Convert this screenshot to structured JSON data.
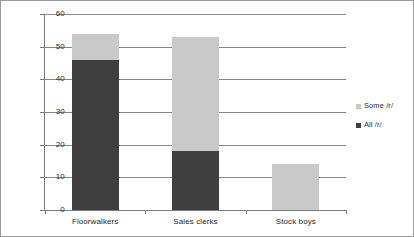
{
  "chart_data": {
    "type": "bar",
    "subtype": "stacked-bar",
    "title": "",
    "subtitle": "",
    "xlabel": "",
    "ylabel": "",
    "categories": [
      "Floorwalkers",
      "Sales clerks",
      "Stock boys"
    ],
    "series": [
      {
        "name": "All /r/",
        "color": "#3f3f3f",
        "values": [
          46,
          18,
          0
        ]
      },
      {
        "name": "Some /r/",
        "color": "#c9c9c9",
        "values": [
          8,
          35,
          14
        ]
      }
    ],
    "totals": [
      54,
      53,
      14
    ],
    "ylim": [
      0,
      60
    ],
    "ytick_step": 10,
    "yticks": [
      0,
      10,
      20,
      30,
      40,
      50,
      60
    ],
    "ytick_labels": [
      "0",
      "10",
      "20",
      "30",
      "40",
      "50",
      "60"
    ],
    "grid": "horizontal",
    "legend_position": "right",
    "legend_entries": [
      "Some /r/",
      "All /r/"
    ],
    "plot_border": true,
    "background_color": "#ffffff",
    "gridline_color": "#858585",
    "axis_color": "#7b7b7b"
  }
}
